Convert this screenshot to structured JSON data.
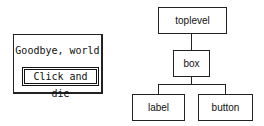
{
  "app_window": {
    "label_text": "Goodbye, world",
    "button_label": "Click and die"
  },
  "widget_tree": {
    "nodes": [
      {
        "id": "toplevel",
        "label": "toplevel"
      },
      {
        "id": "box",
        "label": "box"
      },
      {
        "id": "label",
        "label": "label"
      },
      {
        "id": "button",
        "label": "button"
      }
    ],
    "edges": [
      {
        "from": "toplevel",
        "to": "box"
      },
      {
        "from": "box",
        "to": "label"
      },
      {
        "from": "box",
        "to": "button"
      }
    ]
  }
}
